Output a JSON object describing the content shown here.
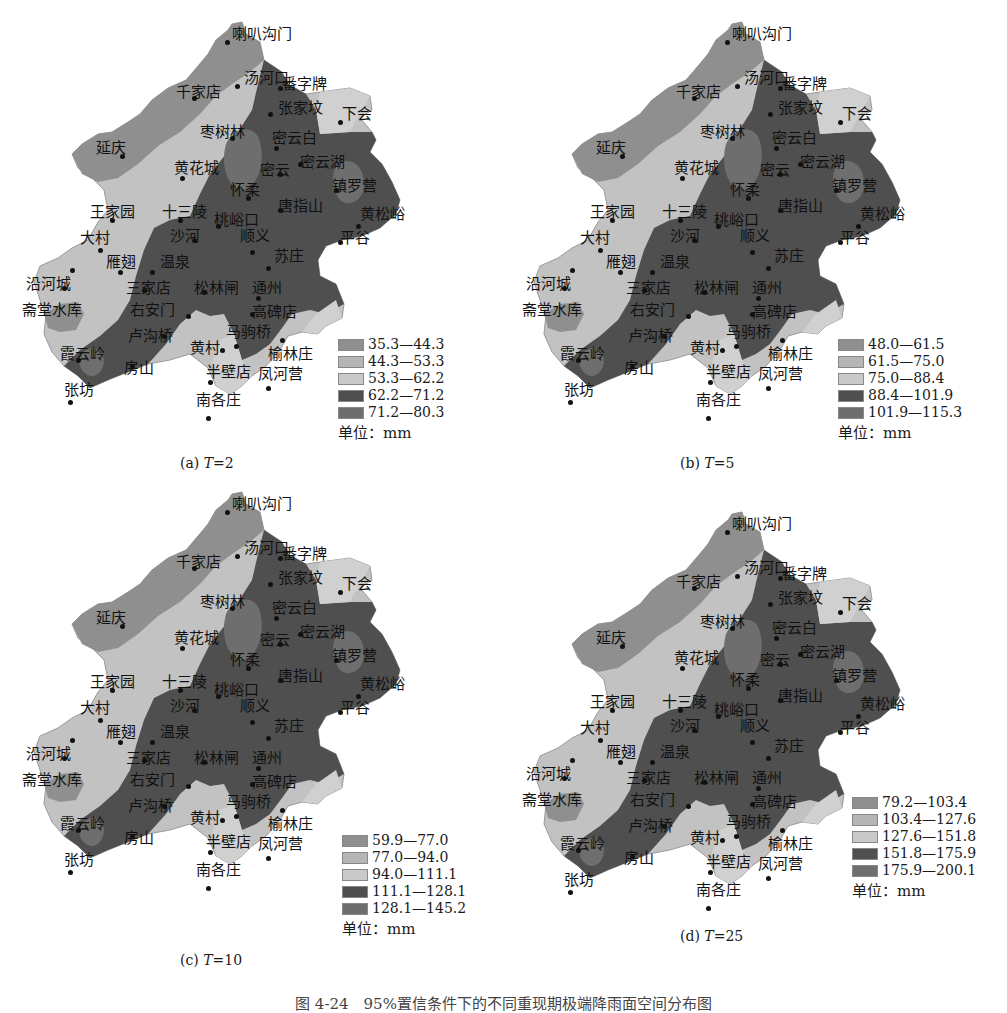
{
  "figure_caption": "图 4-24　95%置信条件下的不同重现期极端降雨面空间分布图",
  "unit_label": "单位：mm",
  "gray_scale": {
    "class1": "#8f8f8f",
    "class2": "#b5b5b5",
    "class3": "#c9c9c9",
    "class4": "#4f4f4f",
    "class5": "#6e6e6e"
  },
  "stations": [
    "喇叭沟门",
    "汤河口",
    "番字牌",
    "千家店",
    "张家坟",
    "下会",
    "枣树林",
    "延庆",
    "密云白",
    "黄花城",
    "密云",
    "密云湖",
    "镇罗营",
    "怀柔",
    "王家园",
    "十三陵",
    "唐指山",
    "黄松峪",
    "桃峪口",
    "大村",
    "沙河",
    "顺义",
    "平谷",
    "雁翅",
    "温泉",
    "苏庄",
    "沿河城",
    "三家店",
    "松林闸",
    "通州",
    "斋堂水库",
    "右安门",
    "高碑店",
    "卢沟桥",
    "马驹桥",
    "霞云岭",
    "黄村",
    "榆林庄",
    "房山",
    "半壁店",
    "凤河营",
    "张坊",
    "南各庄"
  ],
  "panels": [
    {
      "id": "a",
      "caption_prefix": "(a) ",
      "caption_var": "T",
      "caption_value": "=2",
      "legend": [
        "35.3—44.3",
        "44.3—53.3",
        "53.3—62.2",
        "62.2—71.2",
        "71.2—80.3"
      ]
    },
    {
      "id": "b",
      "caption_prefix": "(b) ",
      "caption_var": "T",
      "caption_value": "=5",
      "legend": [
        "48.0—61.5",
        "61.5—75.0",
        "75.0—88.4",
        "88.4—101.9",
        "101.9—115.3"
      ]
    },
    {
      "id": "c",
      "caption_prefix": "(c) ",
      "caption_var": "T",
      "caption_value": "=10",
      "legend": [
        "59.9—77.0",
        "77.0—94.0",
        "94.0—111.1",
        "111.1—128.1",
        "128.1—145.2"
      ]
    },
    {
      "id": "d",
      "caption_prefix": "(d) ",
      "caption_var": "T",
      "caption_value": "=25",
      "legend": [
        "79.2—103.4",
        "103.4—127.6",
        "127.6—151.8",
        "151.8—175.9",
        "175.9—200.1"
      ]
    }
  ],
  "chart_data": [
    {
      "type": "heatmap",
      "title": "(a) T=2",
      "map": "Beijing extreme rainfall spatial distribution",
      "legend": [
        "35.3—44.3",
        "44.3—53.3",
        "53.3—62.2",
        "62.2—71.2",
        "71.2—80.3"
      ],
      "unit": "mm",
      "range": [
        35.3,
        80.3
      ]
    },
    {
      "type": "heatmap",
      "title": "(b) T=5",
      "map": "Beijing extreme rainfall spatial distribution",
      "legend": [
        "48.0—61.5",
        "61.5—75.0",
        "75.0—88.4",
        "88.4—101.9",
        "101.9—115.3"
      ],
      "unit": "mm",
      "range": [
        48.0,
        115.3
      ]
    },
    {
      "type": "heatmap",
      "title": "(c) T=10",
      "map": "Beijing extreme rainfall spatial distribution",
      "legend": [
        "59.9—77.0",
        "77.0—94.0",
        "94.0—111.1",
        "111.1—128.1",
        "128.1—145.2"
      ],
      "unit": "mm",
      "range": [
        59.9,
        145.2
      ]
    },
    {
      "type": "heatmap",
      "title": "(d) T=25",
      "map": "Beijing extreme rainfall spatial distribution",
      "legend": [
        "79.2—103.4",
        "103.4—127.6",
        "127.6—151.8",
        "151.8—175.9",
        "175.9—200.1"
      ],
      "unit": "mm",
      "range": [
        79.2,
        200.1
      ]
    }
  ]
}
